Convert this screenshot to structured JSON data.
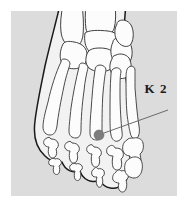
{
  "figure": {
    "title": "K 2",
    "background_color": "#dcdcdc",
    "page_color": "#ffffff",
    "outline_color": "#1a1a1a",
    "bone_fill_color": "#fbfbfb",
    "bone_stroke_color": "#4a4a4a",
    "shadow_color": "#b8b8b8"
  },
  "annotation": {
    "label": "K 2",
    "marker": {
      "name": "acupoint-marker",
      "color": "#7d7d7d",
      "cx": 99,
      "cy": 135,
      "r": 5
    },
    "leader_line": {
      "color": "#6b6b6b",
      "x1": 104,
      "y1": 133,
      "x2": 168,
      "y2": 110
    }
  },
  "anatomy": {
    "regions": [
      "tarsals",
      "metatarsals",
      "proximal-phalanges",
      "middle-phalanges",
      "distal-phalanges"
    ]
  }
}
